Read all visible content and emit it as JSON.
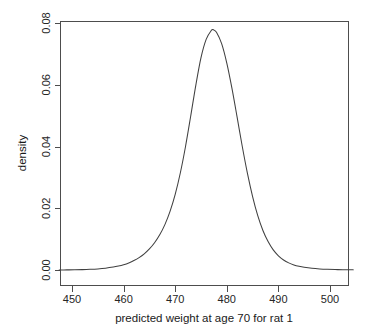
{
  "chart_data": {
    "type": "line",
    "title": "",
    "subtitle": "",
    "xlabel": "predicted weight at age 70 for rat 1",
    "ylabel": "density",
    "xlim": [
      447.5,
      504.5
    ],
    "ylim": [
      0.0,
      0.0805
    ],
    "grid": false,
    "legend": null,
    "x_ticks": [
      450,
      460,
      470,
      480,
      490,
      500
    ],
    "x_tick_labels": [
      "450",
      "460",
      "470",
      "480",
      "490",
      "500"
    ],
    "y_ticks": [
      0.0,
      0.02,
      0.04,
      0.06,
      0.08
    ],
    "y_tick_labels": [
      "0.00",
      "0.02",
      "0.04",
      "0.06",
      "0.08"
    ],
    "series": [
      {
        "name": "density",
        "peak_x": 477.4,
        "peak_y": 0.0778,
        "x": [
          447.5,
          449.0,
          450.5,
          452.0,
          453.5,
          455.0,
          456.5,
          458.0,
          459.0,
          460.0,
          461.0,
          462.0,
          463.0,
          464.0,
          465.0,
          466.0,
          467.0,
          468.0,
          469.0,
          470.0,
          471.0,
          472.0,
          473.0,
          474.0,
          475.0,
          476.0,
          477.0,
          477.4,
          478.0,
          479.0,
          480.0,
          481.0,
          482.0,
          483.0,
          484.0,
          485.0,
          486.0,
          487.0,
          488.0,
          489.0,
          490.0,
          491.0,
          492.0,
          493.0,
          494.0,
          495.0,
          496.5,
          498.0,
          499.5,
          501.0,
          502.5,
          504.5
        ],
        "y": [
          2e-05,
          4e-05,
          7e-05,
          0.00012,
          0.00021,
          0.00035,
          0.00058,
          0.00094,
          0.00128,
          0.00172,
          0.0023,
          0.00305,
          0.00401,
          0.00524,
          0.00682,
          0.00883,
          0.0114,
          0.0147,
          0.019,
          0.0245,
          0.0315,
          0.04,
          0.0498,
          0.0599,
          0.0688,
          0.0747,
          0.0776,
          0.0778,
          0.077,
          0.0733,
          0.067,
          0.0588,
          0.0495,
          0.04,
          0.0313,
          0.0238,
          0.0176,
          0.0128,
          0.0092,
          0.0065,
          0.0046,
          0.00325,
          0.0023,
          0.00165,
          0.0012,
          0.00088,
          0.00055,
          0.00035,
          0.00022,
          0.00014,
          9e-05,
          5e-05
        ]
      }
    ]
  },
  "axes": {
    "x_title": "predicted weight at age 70 for rat 1",
    "y_title": "density"
  }
}
